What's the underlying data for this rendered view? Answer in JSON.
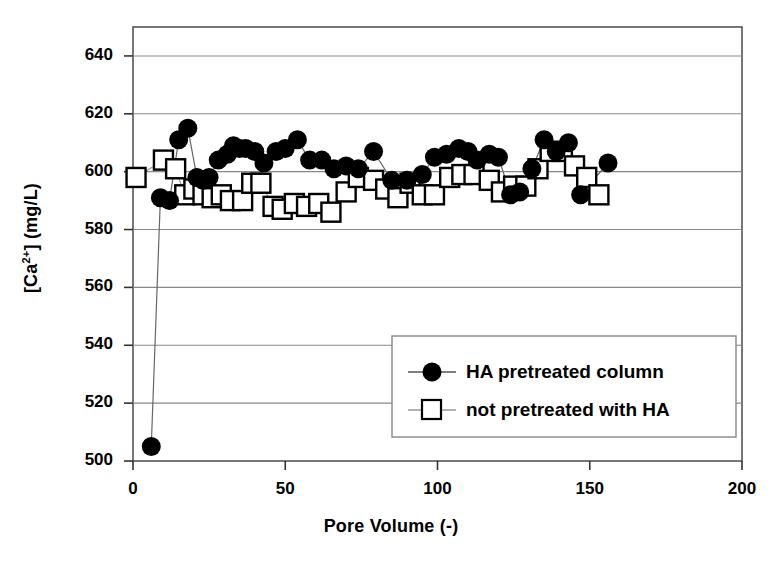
{
  "chart_data": {
    "type": "scatter",
    "title": "",
    "xlabel": "Pore Volume (-)",
    "ylabel": "[Ca2+] (mg/L)",
    "ylabel_parts": {
      "prefix": "[Ca",
      "sup": "2+",
      "suffix": "] (mg/L)"
    },
    "xlim": [
      0,
      200
    ],
    "ylim": [
      500,
      650
    ],
    "xticks": [
      0,
      50,
      100,
      150,
      200
    ],
    "yticks": [
      500,
      520,
      540,
      560,
      580,
      600,
      620,
      640
    ],
    "grid": "horizontal",
    "legend_position": "lower-right",
    "series": [
      {
        "name": "HA pretreated column",
        "marker": "filled-circle",
        "color": "#000000",
        "points": [
          [
            6,
            505
          ],
          [
            9,
            591
          ],
          [
            12,
            590
          ],
          [
            15,
            611
          ],
          [
            18,
            615
          ],
          [
            21,
            598
          ],
          [
            23,
            597
          ],
          [
            25,
            598
          ],
          [
            28,
            604
          ],
          [
            31,
            606
          ],
          [
            33,
            609
          ],
          [
            35,
            608
          ],
          [
            37,
            608
          ],
          [
            40,
            607
          ],
          [
            43,
            603
          ],
          [
            47,
            607
          ],
          [
            50,
            608
          ],
          [
            54,
            611
          ],
          [
            58,
            604
          ],
          [
            62,
            604
          ],
          [
            66,
            601
          ],
          [
            70,
            602
          ],
          [
            74,
            601
          ],
          [
            79,
            607
          ],
          [
            85,
            597
          ],
          [
            90,
            597
          ],
          [
            95,
            599
          ],
          [
            99,
            605
          ],
          [
            103,
            606
          ],
          [
            107,
            608
          ],
          [
            110,
            607
          ],
          [
            113,
            604
          ],
          [
            117,
            606
          ],
          [
            120,
            605
          ],
          [
            124,
            592
          ],
          [
            127,
            593
          ],
          [
            131,
            601
          ],
          [
            135,
            611
          ],
          [
            139,
            607
          ],
          [
            143,
            610
          ],
          [
            147,
            592
          ],
          [
            156,
            603
          ]
        ]
      },
      {
        "name": "not pretreated with HA",
        "marker": "open-square",
        "color": "#000000",
        "points": [
          [
            1,
            598
          ],
          [
            10,
            604
          ],
          [
            14,
            601
          ],
          [
            17,
            592
          ],
          [
            20,
            594
          ],
          [
            23,
            592
          ],
          [
            26,
            591
          ],
          [
            29,
            592
          ],
          [
            32,
            590
          ],
          [
            36,
            590
          ],
          [
            39,
            596
          ],
          [
            42,
            596
          ],
          [
            46,
            588
          ],
          [
            49,
            587
          ],
          [
            53,
            589
          ],
          [
            57,
            588
          ],
          [
            61,
            589
          ],
          [
            65,
            586
          ],
          [
            70,
            593
          ],
          [
            74,
            598
          ],
          [
            79,
            597
          ],
          [
            83,
            594
          ],
          [
            87,
            591
          ],
          [
            91,
            596
          ],
          [
            95,
            592
          ],
          [
            99,
            592
          ],
          [
            104,
            598
          ],
          [
            108,
            599
          ],
          [
            112,
            599
          ],
          [
            117,
            597
          ],
          [
            121,
            593
          ],
          [
            125,
            595
          ],
          [
            129,
            595
          ],
          [
            133,
            601
          ],
          [
            137,
            607
          ],
          [
            141,
            607
          ],
          [
            145,
            602
          ],
          [
            149,
            598
          ],
          [
            153,
            592
          ]
        ]
      }
    ]
  },
  "axis": {
    "x_tick_labels": [
      "0",
      "50",
      "100",
      "150",
      "200"
    ],
    "y_tick_labels": [
      "500",
      "520",
      "540",
      "560",
      "580",
      "600",
      "620",
      "640"
    ]
  },
  "legend": {
    "entries": [
      {
        "label": "HA pretreated column",
        "marker": "filled-circle"
      },
      {
        "label": "not pretreated with HA",
        "marker": "open-square"
      }
    ]
  }
}
